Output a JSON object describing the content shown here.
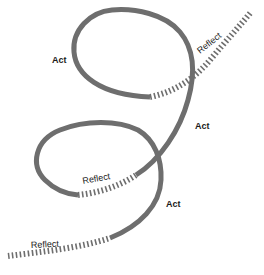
{
  "diagram": {
    "title": "",
    "type": "act-reflect spiral cycle",
    "stroke_color": "#6e6e6e",
    "text_color": "#1a1a1a",
    "background": "#ffffff",
    "labels": {
      "act_top": "Act",
      "reflect_top_right": "Reflect",
      "act_middle_right": "Act",
      "reflect_middle": "Reflect",
      "act_bottom_right": "Act",
      "reflect_bottom_left": "Reflect"
    },
    "segments": [
      {
        "kind": "reflect",
        "style": "dashed",
        "label": "Reflect",
        "position": "bottom-left"
      },
      {
        "kind": "act",
        "style": "solid",
        "label": "Act",
        "position": "bottom-right"
      },
      {
        "kind": "reflect",
        "style": "dashed",
        "label": "Reflect",
        "position": "middle"
      },
      {
        "kind": "act",
        "style": "solid",
        "label": "Act",
        "position": "middle-right / top loop"
      },
      {
        "kind": "reflect",
        "style": "dashed",
        "label": "Reflect",
        "position": "top-right"
      }
    ]
  }
}
